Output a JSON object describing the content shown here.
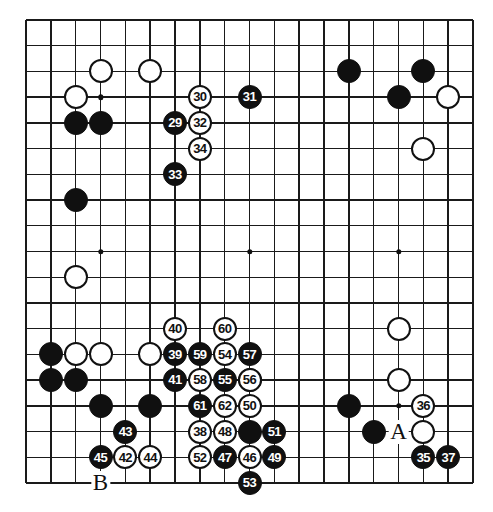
{
  "diagram": {
    "type": "go-board-diagram",
    "board_size": 19,
    "colors": {
      "line": "#1a1a1a",
      "black_stone": "#101010",
      "white_stone": "#ffffff",
      "background": "#ffffff"
    },
    "star_points": [
      {
        "col": 3,
        "row": 3
      },
      {
        "col": 9,
        "row": 3
      },
      {
        "col": 15,
        "row": 3
      },
      {
        "col": 3,
        "row": 9
      },
      {
        "col": 9,
        "row": 9
      },
      {
        "col": 15,
        "row": 9
      },
      {
        "col": 3,
        "row": 15
      },
      {
        "col": 9,
        "row": 15
      },
      {
        "col": 15,
        "row": 15
      }
    ],
    "plain_stones": [
      {
        "col": 3,
        "row": 2,
        "color": "white"
      },
      {
        "col": 5,
        "row": 2,
        "color": "white"
      },
      {
        "col": 13,
        "row": 2,
        "color": "black"
      },
      {
        "col": 16,
        "row": 2,
        "color": "black"
      },
      {
        "col": 2,
        "row": 3,
        "color": "white"
      },
      {
        "col": 15,
        "row": 3,
        "color": "black"
      },
      {
        "col": 17,
        "row": 3,
        "color": "white"
      },
      {
        "col": 2,
        "row": 4,
        "color": "black"
      },
      {
        "col": 3,
        "row": 4,
        "color": "black"
      },
      {
        "col": 16,
        "row": 5,
        "color": "white"
      },
      {
        "col": 2,
        "row": 7,
        "color": "black"
      },
      {
        "col": 2,
        "row": 10,
        "color": "white"
      },
      {
        "col": 15,
        "row": 12,
        "color": "white"
      },
      {
        "col": 1,
        "row": 13,
        "color": "black"
      },
      {
        "col": 2,
        "row": 13,
        "color": "white"
      },
      {
        "col": 3,
        "row": 13,
        "color": "white"
      },
      {
        "col": 5,
        "row": 13,
        "color": "white"
      },
      {
        "col": 15,
        "row": 14,
        "color": "white"
      },
      {
        "col": 1,
        "row": 14,
        "color": "black"
      },
      {
        "col": 2,
        "row": 14,
        "color": "black"
      },
      {
        "col": 3,
        "row": 15,
        "color": "black"
      },
      {
        "col": 5,
        "row": 15,
        "color": "black"
      },
      {
        "col": 13,
        "row": 15,
        "color": "black"
      },
      {
        "col": 14,
        "row": 16,
        "color": "black"
      },
      {
        "col": 16,
        "row": 16,
        "color": "white"
      },
      {
        "col": 9,
        "row": 16,
        "color": "black"
      },
      {
        "col": 9,
        "row": 14,
        "color": "black"
      }
    ],
    "numbered_stones": [
      {
        "n": 29,
        "col": 6,
        "row": 4,
        "color": "black"
      },
      {
        "n": 30,
        "col": 7,
        "row": 3,
        "color": "white"
      },
      {
        "n": 31,
        "col": 9,
        "row": 3,
        "color": "black"
      },
      {
        "n": 32,
        "col": 7,
        "row": 4,
        "color": "white"
      },
      {
        "n": 33,
        "col": 6,
        "row": 6,
        "color": "black"
      },
      {
        "n": 34,
        "col": 7,
        "row": 5,
        "color": "white"
      },
      {
        "n": 35,
        "col": 16,
        "row": 17,
        "color": "black"
      },
      {
        "n": 36,
        "col": 16,
        "row": 15,
        "color": "white"
      },
      {
        "n": 37,
        "col": 17,
        "row": 17,
        "color": "black"
      },
      {
        "n": 38,
        "col": 7,
        "row": 16,
        "color": "white"
      },
      {
        "n": 39,
        "col": 6,
        "row": 13,
        "color": "black"
      },
      {
        "n": 40,
        "col": 6,
        "row": 12,
        "color": "white"
      },
      {
        "n": 41,
        "col": 6,
        "row": 14,
        "color": "black"
      },
      {
        "n": 42,
        "col": 4,
        "row": 17,
        "color": "white"
      },
      {
        "n": 43,
        "col": 4,
        "row": 16,
        "color": "black"
      },
      {
        "n": 44,
        "col": 5,
        "row": 17,
        "color": "white"
      },
      {
        "n": 45,
        "col": 3,
        "row": 17,
        "color": "black"
      },
      {
        "n": 46,
        "col": 9,
        "row": 17,
        "color": "white"
      },
      {
        "n": 47,
        "col": 8,
        "row": 17,
        "color": "black"
      },
      {
        "n": 48,
        "col": 8,
        "row": 16,
        "color": "white"
      },
      {
        "n": 49,
        "col": 10,
        "row": 17,
        "color": "black"
      },
      {
        "n": 50,
        "col": 9,
        "row": 15,
        "color": "white"
      },
      {
        "n": 51,
        "col": 10,
        "row": 16,
        "color": "black"
      },
      {
        "n": 52,
        "col": 7,
        "row": 17,
        "color": "white"
      },
      {
        "n": 53,
        "col": 9,
        "row": 18,
        "color": "black"
      },
      {
        "n": 54,
        "col": 8,
        "row": 13,
        "color": "white"
      },
      {
        "n": 55,
        "col": 8,
        "row": 14,
        "color": "black"
      },
      {
        "n": 56,
        "col": 9,
        "row": 14,
        "color": "white"
      },
      {
        "n": 57,
        "col": 9,
        "row": 13,
        "color": "black"
      },
      {
        "n": 58,
        "col": 7,
        "row": 14,
        "color": "white"
      },
      {
        "n": 59,
        "col": 7,
        "row": 13,
        "color": "black"
      },
      {
        "n": 60,
        "col": 8,
        "row": 12,
        "color": "white"
      },
      {
        "n": 61,
        "col": 7,
        "row": 15,
        "color": "black"
      },
      {
        "n": 62,
        "col": 8,
        "row": 15,
        "color": "white"
      }
    ],
    "point_labels": [
      {
        "text": "A",
        "col": 15,
        "row": 16
      },
      {
        "text": "B",
        "col": 3,
        "row": 18
      }
    ]
  }
}
